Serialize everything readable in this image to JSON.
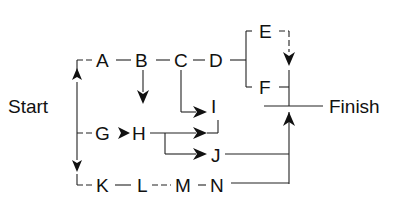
{
  "diagram": {
    "type": "activity-network",
    "start_label": "Start",
    "finish_label": "Finish",
    "nodes": {
      "A": "A",
      "B": "B",
      "C": "C",
      "D": "D",
      "E": "E",
      "F": "F",
      "G": "G",
      "H": "H",
      "I": "I",
      "J": "J",
      "K": "K",
      "L": "L",
      "M": "M",
      "N": "N"
    },
    "edges": [
      [
        "Start",
        "A"
      ],
      [
        "A",
        "B"
      ],
      [
        "B",
        "C"
      ],
      [
        "C",
        "D"
      ],
      [
        "D",
        "E"
      ],
      [
        "D",
        "F"
      ],
      [
        "E",
        "F"
      ],
      [
        "F",
        "Finish"
      ],
      [
        "B",
        "H"
      ],
      [
        "C",
        "I"
      ],
      [
        "Start",
        "G"
      ],
      [
        "G",
        "H"
      ],
      [
        "H",
        "I"
      ],
      [
        "H",
        "J"
      ],
      [
        "I",
        "Finish"
      ],
      [
        "J",
        "Finish"
      ],
      [
        "Start",
        "K"
      ],
      [
        "K",
        "L"
      ],
      [
        "L",
        "M"
      ],
      [
        "M",
        "N"
      ],
      [
        "N",
        "Finish"
      ]
    ]
  }
}
